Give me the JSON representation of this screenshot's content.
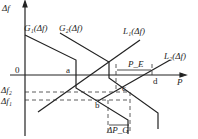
{
  "axes": {
    "y_label": "Δf",
    "x_label": "P",
    "origin": "0"
  },
  "curves": {
    "g1": "G₁(Δf)",
    "g2": "G₂(Δf)",
    "l1": "L₁(Δf)",
    "l2": "L₂(Δf)"
  },
  "levels": {
    "df2": "Δf₂",
    "df1": "Δf₁"
  },
  "points": {
    "a": "a",
    "b": "b",
    "c": "c",
    "d": "d"
  },
  "dims": {
    "pe": "P_E",
    "dpg": "ΔP_G"
  },
  "colors": {
    "line": "#222222",
    "dash": "#333333"
  }
}
